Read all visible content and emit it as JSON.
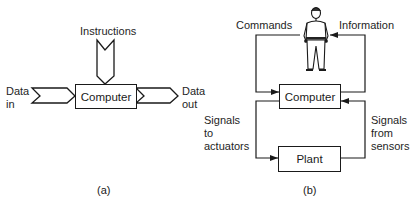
{
  "diagram_a": {
    "caption": "(a)",
    "instructions_label": "Instructions",
    "computer_label": "Computer",
    "data_in_label": [
      "Data",
      "in"
    ],
    "data_out_label": [
      "Data",
      "out"
    ]
  },
  "diagram_b": {
    "caption": "(b)",
    "commands_label": "Commands",
    "information_label": "Information",
    "computer_label": "Computer",
    "plant_label": "Plant",
    "signals_to_actuators_label": [
      "Signals",
      "to",
      "actuators"
    ],
    "signals_from_sensors_label": [
      "Signals",
      "from",
      "sensors"
    ],
    "operator_icon": "person-figure"
  }
}
